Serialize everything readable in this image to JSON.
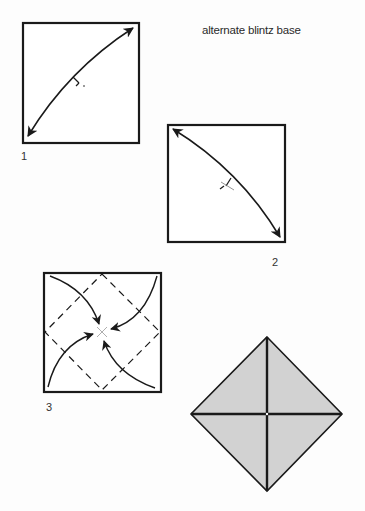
{
  "diagram": {
    "title": "alternate blintz base",
    "steps": [
      {
        "number": "1",
        "description": "Fold and unfold diagonally (bottom-left to top-right corner)"
      },
      {
        "number": "2",
        "description": "Fold and unfold along the other diagonal"
      },
      {
        "number": "3",
        "description": "Fold all four corners to the center along the dashed lines"
      },
      {
        "number": "",
        "description": "Finished alternate blintz base (shaded square rotated as diamond)"
      }
    ],
    "colors": {
      "line": "#1a1a1a",
      "paper": "#ffffff",
      "shaded": "#d2d2d2",
      "background": "#fdfdfd"
    }
  }
}
